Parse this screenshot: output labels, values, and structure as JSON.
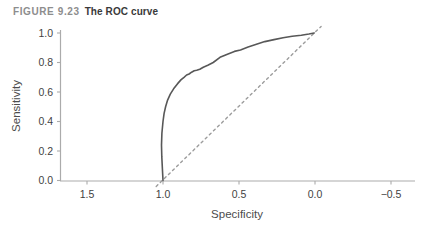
{
  "figure": {
    "label": "FIGURE 9.23",
    "title": "The ROC curve"
  },
  "chart_data": {
    "type": "line",
    "title": "",
    "xlabel": "Specificity",
    "ylabel": "Sensitivity",
    "x_axis_reversed": true,
    "xlim": [
      1.75,
      -0.66
    ],
    "ylim": [
      0.0,
      1.0
    ],
    "grid": false,
    "legend": "none",
    "x_ticks": {
      "values": [
        1.5,
        1.0,
        0.5,
        0.0,
        -0.5
      ],
      "labels": [
        "1.5",
        "1.0",
        "0.5",
        "0.0",
        "−0.5"
      ]
    },
    "y_ticks": {
      "values": [
        0.0,
        0.2,
        0.4,
        0.6,
        0.8,
        1.0
      ],
      "labels": [
        "0.0",
        "0.2",
        "0.4",
        "0.6",
        "0.8",
        "1.0"
      ]
    },
    "axis_color": "#ababab",
    "tick_label_color": "#3f3f3f",
    "axis_label_color": "#4c4c4c",
    "series": [
      {
        "name": "chance diagonal",
        "line_style": "dashed",
        "color": "#9c9c9c",
        "points": [
          [
            1.045,
            -0.04
          ],
          [
            -0.04,
            1.045
          ]
        ]
      },
      {
        "name": "ROC curve",
        "line_style": "solid",
        "color": "#585858",
        "points": [
          [
            1.0,
            0.0
          ],
          [
            1.004,
            0.08
          ],
          [
            1.008,
            0.16
          ],
          [
            1.01,
            0.24
          ],
          [
            1.007,
            0.32
          ],
          [
            1.0,
            0.4
          ],
          [
            0.993,
            0.455
          ],
          [
            0.983,
            0.5
          ],
          [
            0.97,
            0.545
          ],
          [
            0.952,
            0.585
          ],
          [
            0.93,
            0.622
          ],
          [
            0.905,
            0.655
          ],
          [
            0.882,
            0.682
          ],
          [
            0.862,
            0.7
          ],
          [
            0.845,
            0.715
          ],
          [
            0.828,
            0.722
          ],
          [
            0.812,
            0.734
          ],
          [
            0.795,
            0.744
          ],
          [
            0.778,
            0.747
          ],
          [
            0.758,
            0.754
          ],
          [
            0.735,
            0.768
          ],
          [
            0.705,
            0.782
          ],
          [
            0.67,
            0.8
          ],
          [
            0.625,
            0.835
          ],
          [
            0.58,
            0.855
          ],
          [
            0.53,
            0.875
          ],
          [
            0.49,
            0.885
          ],
          [
            0.44,
            0.905
          ],
          [
            0.39,
            0.922
          ],
          [
            0.33,
            0.942
          ],
          [
            0.27,
            0.955
          ],
          [
            0.21,
            0.968
          ],
          [
            0.15,
            0.978
          ],
          [
            0.09,
            0.985
          ],
          [
            0.04,
            0.993
          ],
          [
            0.005,
            1.0
          ]
        ]
      }
    ]
  }
}
